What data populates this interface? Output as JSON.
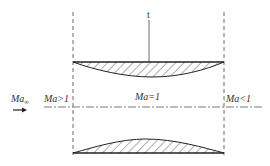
{
  "diagram": {
    "labels": {
      "throat_marker": "t",
      "freestream": "Ma",
      "freestream_sub": "∞",
      "upstream": "Ma>1",
      "throat": "Ma=1",
      "downstream": "Ma<1"
    },
    "colors": {
      "line": "#222222",
      "hatch": "#333333",
      "text": "#333333"
    }
  }
}
